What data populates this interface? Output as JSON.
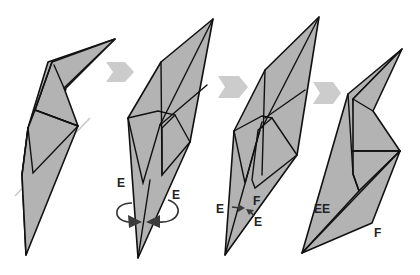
{
  "diagram": {
    "type": "origami-instruction-sequence",
    "colors": {
      "paper": "#b3b3b3",
      "outline": "#111111",
      "step_arrow": "#cccccc",
      "guide_line": "#c8c8c8",
      "label": "#222222"
    },
    "steps": [
      {
        "index": 1,
        "description": "Folded model with light dashed guide line crossing it diagonally",
        "labels": []
      },
      {
        "index": 2,
        "description": "Rotate flaps E around the bottom point (curved rotation arrows)",
        "labels": [
          {
            "text": "E",
            "position": "left"
          },
          {
            "text": "E",
            "position": "right"
          }
        ]
      },
      {
        "index": 3,
        "description": "Flaps E pushed inward; point F marked",
        "labels": [
          {
            "text": "E",
            "position": "left"
          },
          {
            "text": "F",
            "position": "top"
          },
          {
            "text": "E",
            "position": "right"
          }
        ]
      },
      {
        "index": 4,
        "description": "Result: bent shape with flaps EE and point F",
        "labels": [
          {
            "text": "EE",
            "position": "left"
          },
          {
            "text": "F",
            "position": "right"
          }
        ]
      }
    ],
    "step_arrows": [
      {
        "from": 1,
        "to": 2
      },
      {
        "from": 2,
        "to": 3
      },
      {
        "from": 3,
        "to": 4
      }
    ]
  }
}
